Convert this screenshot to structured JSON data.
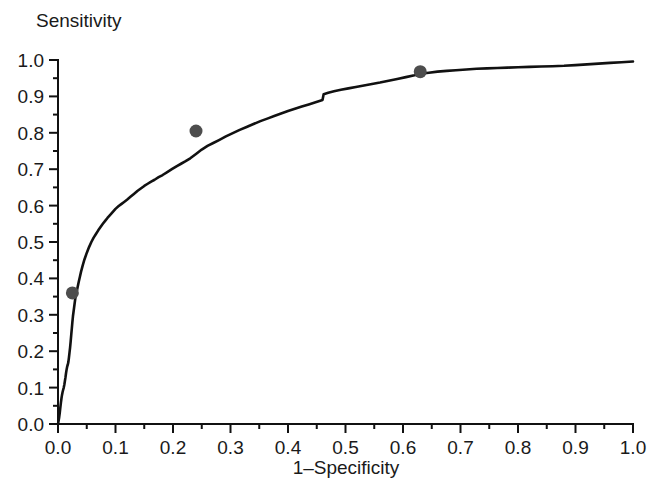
{
  "figure": {
    "background_color": "#ffffff",
    "line_color": "#111111",
    "marker_color": "#4d4d4d"
  },
  "labels": {
    "y_axis_title": "Sensitivity",
    "x_axis_title": "1–Specificity"
  },
  "chart_data": {
    "type": "line",
    "title": "",
    "subtitle": "",
    "xlabel": "1–Specificity",
    "ylabel": "Sensitivity",
    "xlim": [
      0.0,
      1.0
    ],
    "ylim": [
      0.0,
      1.0
    ],
    "grid": false,
    "legend": null,
    "x_ticks": [
      0.0,
      0.1,
      0.2,
      0.3,
      0.4,
      0.5,
      0.6,
      0.7,
      0.8,
      0.9,
      1.0
    ],
    "x_tick_labels": [
      "0.0",
      "0.1",
      "0.2",
      "0.3",
      "0.4",
      "0.5",
      "0.6",
      "0.7",
      "0.8",
      "0.9",
      "1.0"
    ],
    "x_minor_ticks": [
      0.05,
      0.15,
      0.25,
      0.35,
      0.45,
      0.55,
      0.65,
      0.75,
      0.85,
      0.95
    ],
    "y_ticks": [
      0.0,
      0.1,
      0.2,
      0.3,
      0.4,
      0.5,
      0.6,
      0.7,
      0.8,
      0.9,
      1.0
    ],
    "y_tick_labels": [
      "0.0",
      "0.1",
      "0.2",
      "0.3",
      "0.4",
      "0.5",
      "0.6",
      "0.7",
      "0.8",
      "0.9",
      "1.0"
    ],
    "y_minor_ticks": [
      0.05,
      0.15,
      0.25,
      0.35,
      0.45,
      0.55,
      0.65,
      0.75,
      0.85,
      0.95
    ],
    "series": [
      {
        "name": "ROC curve",
        "x": [
          0.0,
          0.002,
          0.003,
          0.004,
          0.005,
          0.006,
          0.007,
          0.008,
          0.009,
          0.01,
          0.011,
          0.012,
          0.013,
          0.014,
          0.015,
          0.016,
          0.017,
          0.018,
          0.019,
          0.02,
          0.021,
          0.022,
          0.023,
          0.024,
          0.025,
          0.026,
          0.028,
          0.03,
          0.032,
          0.034,
          0.036,
          0.038,
          0.04,
          0.043,
          0.046,
          0.05,
          0.054,
          0.058,
          0.062,
          0.066,
          0.07,
          0.074,
          0.078,
          0.082,
          0.086,
          0.09,
          0.095,
          0.1,
          0.105,
          0.11,
          0.115,
          0.12,
          0.126,
          0.132,
          0.138,
          0.144,
          0.15,
          0.156,
          0.162,
          0.168,
          0.175,
          0.182,
          0.19,
          0.198,
          0.206,
          0.214,
          0.222,
          0.23,
          0.24,
          0.25,
          0.26,
          0.27,
          0.28,
          0.292,
          0.304,
          0.316,
          0.328,
          0.34,
          0.352,
          0.364,
          0.376,
          0.388,
          0.4,
          0.412,
          0.424,
          0.436,
          0.448,
          0.456,
          0.46,
          0.462,
          0.47,
          0.48,
          0.492,
          0.505,
          0.518,
          0.532,
          0.546,
          0.56,
          0.575,
          0.59,
          0.605,
          0.62,
          0.63,
          0.645,
          0.66,
          0.676,
          0.692,
          0.71,
          0.728,
          0.746,
          0.764,
          0.782,
          0.8,
          0.82,
          0.84,
          0.86,
          0.88,
          0.9,
          0.92,
          0.94,
          0.96,
          0.98,
          1.0
        ],
        "y": [
          0.0,
          0.018,
          0.03,
          0.044,
          0.058,
          0.07,
          0.08,
          0.088,
          0.094,
          0.1,
          0.108,
          0.118,
          0.128,
          0.14,
          0.15,
          0.158,
          0.163,
          0.17,
          0.182,
          0.196,
          0.21,
          0.226,
          0.244,
          0.262,
          0.28,
          0.296,
          0.32,
          0.344,
          0.36,
          0.375,
          0.39,
          0.404,
          0.418,
          0.436,
          0.452,
          0.47,
          0.486,
          0.5,
          0.512,
          0.522,
          0.532,
          0.541,
          0.55,
          0.558,
          0.566,
          0.573,
          0.582,
          0.591,
          0.598,
          0.604,
          0.61,
          0.616,
          0.624,
          0.632,
          0.64,
          0.647,
          0.654,
          0.66,
          0.666,
          0.671,
          0.678,
          0.684,
          0.692,
          0.7,
          0.708,
          0.715,
          0.722,
          0.73,
          0.742,
          0.754,
          0.764,
          0.772,
          0.78,
          0.79,
          0.799,
          0.808,
          0.816,
          0.824,
          0.832,
          0.839,
          0.846,
          0.853,
          0.86,
          0.866,
          0.872,
          0.878,
          0.884,
          0.888,
          0.89,
          0.906,
          0.91,
          0.914,
          0.918,
          0.922,
          0.926,
          0.93,
          0.934,
          0.938,
          0.943,
          0.948,
          0.953,
          0.958,
          0.962,
          0.965,
          0.968,
          0.97,
          0.972,
          0.974,
          0.976,
          0.977,
          0.978,
          0.979,
          0.98,
          0.981,
          0.982,
          0.983,
          0.984,
          0.986,
          0.988,
          0.99,
          0.992,
          0.994,
          0.996
        ]
      }
    ],
    "cutpoints": [
      {
        "name": "cutpoint-low",
        "x": 0.025,
        "y": 0.36
      },
      {
        "name": "cutpoint-mid",
        "x": 0.24,
        "y": 0.805
      },
      {
        "name": "cutpoint-high",
        "x": 0.63,
        "y": 0.968
      }
    ]
  }
}
